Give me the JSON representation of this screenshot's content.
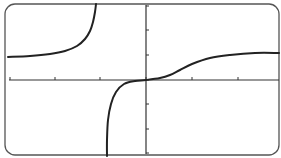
{
  "chart_data": {
    "type": "line",
    "title": "",
    "xlabel": "",
    "ylabel": "",
    "grid": false,
    "legend": "none",
    "frame": "rounded-rectangle",
    "x_ticks_px": [
      10,
      55,
      100,
      146,
      192,
      238
    ],
    "y_ticks_px": [
      6,
      30,
      55,
      80,
      104,
      129,
      153
    ],
    "axis_origin_px": [
      146,
      80
    ],
    "vertical_asymptote_px_x": 101,
    "series": [
      {
        "name": "left-branch",
        "description": "Starts near a horizontal asymptote above the x-axis on the left, rises steeply toward +infinity approaching the vertical asymptote",
        "points_px": [
          [
            8,
            57
          ],
          [
            30,
            56
          ],
          [
            50,
            54
          ],
          [
            65,
            51
          ],
          [
            77,
            46
          ],
          [
            85,
            39
          ],
          [
            90,
            31
          ],
          [
            93,
            22
          ],
          [
            95,
            12
          ],
          [
            96,
            4
          ]
        ]
      },
      {
        "name": "right-branch",
        "description": "Comes from -infinity just right of the vertical asymptote, flattens through the origin with an inflection, then rises to level off near a horizontal asymptote above the axis",
        "points_px": [
          [
            107,
            156
          ],
          [
            107,
            140
          ],
          [
            108,
            120
          ],
          [
            111,
            104
          ],
          [
            116,
            92
          ],
          [
            124,
            84
          ],
          [
            135,
            81
          ],
          [
            146,
            80
          ],
          [
            160,
            78
          ],
          [
            170,
            75
          ],
          [
            180,
            70
          ],
          [
            192,
            64
          ],
          [
            210,
            58
          ],
          [
            230,
            55
          ],
          [
            255,
            53
          ],
          [
            279,
            53
          ]
        ]
      }
    ],
    "colors": {
      "curve": "#222222",
      "axis": "#333333",
      "frame": "#555555",
      "background": "#ffffff"
    }
  }
}
